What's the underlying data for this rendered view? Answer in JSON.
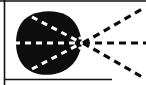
{
  "figure": {
    "type": "schematic-diagram",
    "canvas": {
      "width": 146,
      "height": 85
    },
    "colors": {
      "background": "#ffffff",
      "ink": "#0a0a0a",
      "blob_fill": "#0d0d0d",
      "dash_light": "#ffffff",
      "dash_dark": "#0a0a0a",
      "frame": "#111111"
    },
    "frame": {
      "left_rule": {
        "x": 4.5,
        "y1": 0,
        "y2": 85,
        "width": 1.6
      },
      "top_rule": {
        "y": 1.0,
        "x1": 0,
        "x2": 146,
        "width": 1.4
      },
      "bottom_rule": {
        "y": 79.5,
        "x1": 5,
        "x2": 112,
        "width": 1.6
      }
    },
    "blob": {
      "label": "source-region",
      "apex": {
        "x": 82,
        "y": 43
      },
      "bounds": {
        "left": 16,
        "right": 82,
        "top": 12,
        "bottom": 74
      },
      "path": "M 82 43 C 80 30 76 20 66 15 C 56 10 42 10 31 15 C 20 20 16 31 16 43 C 16 56 21 67 32 72 C 44 77 58 75 67 69 C 76 63 80 54 82 43 Z"
    },
    "interior_dashes": {
      "stroke": "#ffffff",
      "width": 3.0,
      "dasharray": "6 5",
      "lines": [
        {
          "name": "axis-dash",
          "x1": 14,
          "y1": 43,
          "x2": 82,
          "y2": 43
        },
        {
          "name": "upper-chord-dash",
          "x1": 32,
          "y1": 17,
          "x2": 82,
          "y2": 43
        },
        {
          "name": "lower-chord-dash",
          "x1": 32,
          "y1": 69,
          "x2": 82,
          "y2": 43
        }
      ]
    },
    "exterior_rays": {
      "stroke": "#0a0a0a",
      "width": 3.2,
      "dasharray": "7 5",
      "lines": [
        {
          "name": "ray-upper",
          "x1": 83,
          "y1": 43,
          "x2": 142,
          "y2": 9
        },
        {
          "name": "ray-axis",
          "x1": 83,
          "y1": 43,
          "x2": 146,
          "y2": 43
        },
        {
          "name": "ray-lower",
          "x1": 83,
          "y1": 43,
          "x2": 142,
          "y2": 77
        }
      ]
    },
    "notches": [
      {
        "name": "apex-notch-upper",
        "cx": 80,
        "cy": 38,
        "r": 1.6
      },
      {
        "name": "apex-notch-lower",
        "cx": 80,
        "cy": 48,
        "r": 1.6
      }
    ]
  }
}
